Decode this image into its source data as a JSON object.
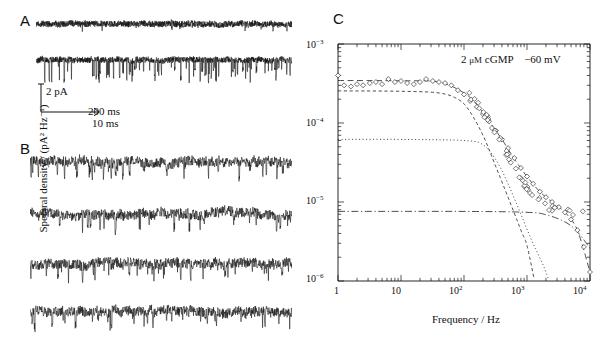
{
  "figure": {
    "panels": [
      {
        "letter": "A",
        "name": "panel-a",
        "trace_count": 2
      },
      {
        "letter": "B",
        "name": "panel-b",
        "trace_count": 4
      },
      {
        "letter": "C",
        "name": "panel-c",
        "trace_count": 0
      }
    ]
  },
  "scalebar": {
    "amplitude": "2 pA",
    "time_a": "200 ms",
    "time_b": "10 ms"
  },
  "chart_annotation": {
    "concentration": "2",
    "units": "μM",
    "ligand": "cGMP",
    "voltage": "−60 mV",
    "full": "2 μM cGMP   −60 mV"
  },
  "chart_data": {
    "type": "scatter",
    "title": "",
    "xlabel": "Frequency / Hz",
    "ylabel": "Spectral density / (pA² Hz⁻¹)",
    "xscale": "log",
    "yscale": "log",
    "xlim": [
      1,
      10000
    ],
    "ylim": [
      1e-06,
      0.001
    ],
    "grid": false,
    "legend": "none",
    "xticks": [
      1,
      10,
      100,
      1000,
      10000
    ],
    "xticklabels": [
      "1",
      "10",
      "10²",
      "10³",
      "10⁴"
    ],
    "yticks": [
      1e-06,
      1e-05,
      0.0001,
      0.001
    ],
    "yticklabels": [
      "10⁻⁶",
      "10⁻⁵",
      "10⁻⁴",
      "10⁻³"
    ],
    "marker": "open-diamond",
    "series": [
      {
        "name": "measured spectral density",
        "style": "open diamond markers",
        "x": [
          1.0,
          1.25,
          1.6,
          2.0,
          2.5,
          3.2,
          4.0,
          5.0,
          6.3,
          8.0,
          10.0,
          12.5,
          16.0,
          20.0,
          25.0,
          32.0,
          40.0,
          50.0,
          63.0,
          80.0,
          100.0,
          125.0,
          160.0,
          200.0,
          250.0,
          320.0,
          400.0,
          500.0,
          630.0,
          800.0,
          1000.0,
          1250.0,
          1600.0,
          2000.0,
          2500.0,
          3200.0,
          4000.0,
          5000.0,
          6300.0,
          8000.0,
          10000.0
        ],
        "y": [
          0.0004,
          0.0003,
          0.00029,
          0.00031,
          0.0003,
          0.00032,
          0.00033,
          0.00031,
          0.00036,
          0.00033,
          0.00034,
          0.00032,
          0.00031,
          0.00033,
          0.00036,
          0.00034,
          0.00033,
          0.00032,
          0.0003,
          0.00026,
          0.00023,
          0.00019,
          0.00016,
          0.00013,
          0.000105,
          8e-05,
          6.2e-05,
          4.8e-05,
          3.6e-05,
          2.7e-05,
          2.1e-05,
          1.7e-05,
          1.35e-05,
          1.15e-05,
          1e-05,
          8.6e-06,
          7.4e-06,
          6e-06,
          4.4e-06,
          2.7e-06,
          1.3e-06
        ]
      },
      {
        "name": "sum fit",
        "style": "long-dashed",
        "plateau": 0.00034,
        "corner_hz": 160,
        "x": [
          1,
          10,
          40,
          100,
          160,
          250,
          400,
          630,
          1000,
          1600,
          2500,
          4000,
          6300,
          10000
        ],
        "y": [
          0.000345,
          0.000342,
          0.00033,
          0.00024,
          0.00017,
          0.000105,
          6.2e-05,
          3.5e-05,
          2.1e-05,
          1.35e-05,
          1e-05,
          7.4e-06,
          4.4e-06,
          1.3e-06
        ]
      },
      {
        "name": "lorentzian component 1 (fast)",
        "style": "short-dashed",
        "plateau": 0.00025,
        "corner_hz": 120,
        "x": [
          1,
          10,
          40,
          80,
          120,
          200,
          320,
          500,
          800,
          1000,
          1300
        ],
        "y": [
          0.000255,
          0.000252,
          0.00024,
          0.0002,
          0.000145,
          7e-05,
          2.8e-05,
          1.15e-05,
          4.4e-06,
          2.8e-06,
          1.05e-06
        ]
      },
      {
        "name": "lorentzian component 2 (slow)",
        "style": "dotted",
        "plateau": 6.2e-05,
        "corner_hz": 330,
        "x": [
          1,
          10,
          100,
          200,
          330,
          500,
          800,
          1200,
          1800,
          2200
        ],
        "y": [
          6.2e-05,
          6.2e-05,
          6e-05,
          5.3e-05,
          3.3e-05,
          1.7e-05,
          7e-06,
          3.2e-06,
          1.6e-06,
          1.05e-06
        ]
      },
      {
        "name": "background noise",
        "style": "dash-dot",
        "plateau": 7.5e-06,
        "x": [
          1,
          100,
          1000,
          2000,
          4000,
          6300,
          10000
        ],
        "y": [
          7.6e-06,
          7.6e-06,
          7.4e-06,
          6.9e-06,
          5.6e-06,
          4.2e-06,
          2.6e-06
        ]
      }
    ]
  }
}
